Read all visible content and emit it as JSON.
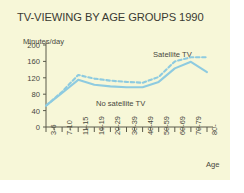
{
  "title": "TV-VIEWING BY AGE GROUPS 1990",
  "ylabel": "Minutes/day",
  "xlabel": "Age",
  "annotations": {
    "satellite": "Satellite TV",
    "no_satellite": "No satellite TV"
  },
  "colors": {
    "background": "#f7f7d8",
    "line": "#8ecbe0",
    "text": "#47473c",
    "axis": "#5a5a4a"
  },
  "chart_data": {
    "type": "line",
    "title": "TV-VIEWING BY AGE GROUPS 1990",
    "xlabel": "Age",
    "ylabel": "Minutes/day",
    "categories": [
      "3-6",
      "7-10",
      "11-15",
      "16-19",
      "20-29",
      "30-39",
      "40-49",
      "50-59",
      "60-69",
      "70-79",
      "80-"
    ],
    "yticks": [
      0,
      40,
      80,
      120,
      160,
      200
    ],
    "ylim": [
      0,
      200
    ],
    "grid": false,
    "legend": "annotated-inline",
    "series": [
      {
        "name": "No satellite TV",
        "style": "solid",
        "values": [
          52,
          83,
          115,
          103,
          99,
          97,
          97,
          110,
          143,
          159,
          134
        ]
      },
      {
        "name": "Satellite TV",
        "style": "dashed",
        "values": [
          52,
          86,
          127,
          118,
          113,
          110,
          108,
          122,
          160,
          170,
          170
        ]
      }
    ]
  }
}
